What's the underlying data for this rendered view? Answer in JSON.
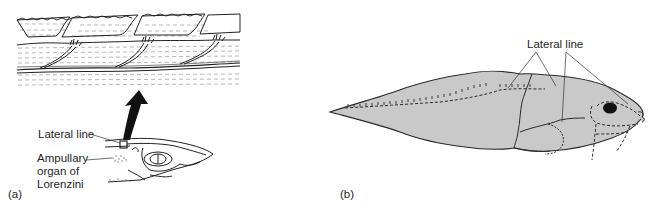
{
  "figure": {
    "panels": [
      {
        "id": "a",
        "tag": "(a)",
        "description": "Shark head with lateral line canal enlarged above",
        "labels": {
          "lateral_line": "Lateral line",
          "ampullary_line1": "Ampullary",
          "ampullary_line2": "organ of",
          "ampullary_line3": "Lorenzini"
        }
      },
      {
        "id": "b",
        "tag": "(b)",
        "description": "Fish (larva) side view showing lateral line canals",
        "labels": {
          "lateral_line": "Lateral line"
        }
      }
    ],
    "colors": {
      "fish_fill": "#c9c9c9",
      "outline": "#2a2a2a",
      "eye": "#111111",
      "background": "#ffffff"
    }
  }
}
